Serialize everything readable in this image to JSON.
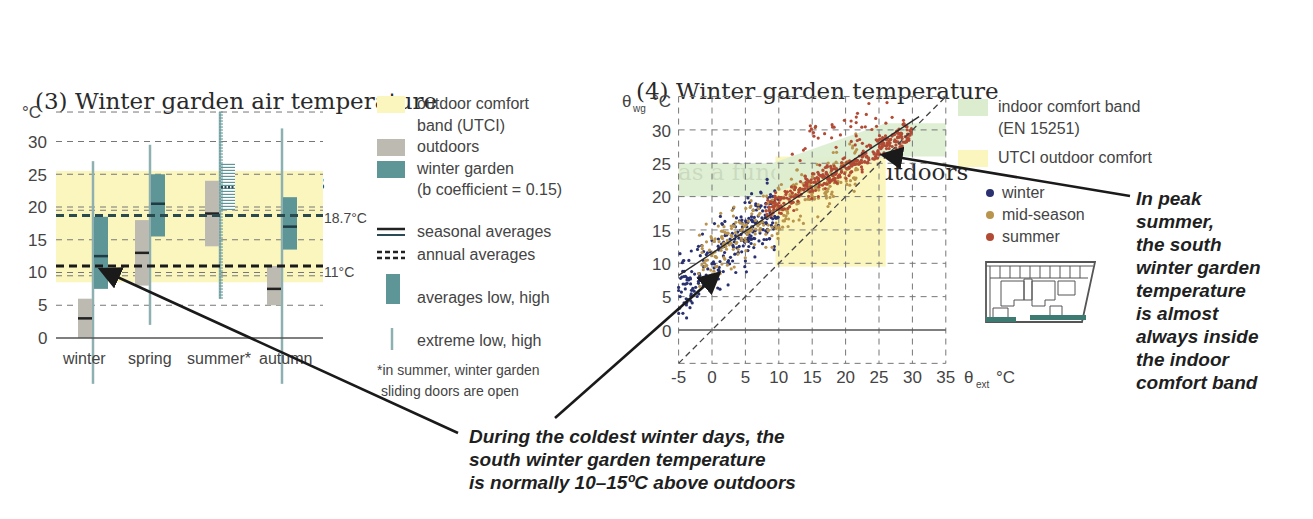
{
  "figure": {
    "chart3": {
      "title_line1": "(3) Winter garden air temperature",
      "title_line2": "compared to outdoors"
    },
    "chart4": {
      "title_line1": "(4) Winter garden temperature",
      "title_line2": "as a function of outdoors"
    },
    "callouts": {
      "winter": "During the coldest winter days, the\nsouth winter garden temperature\nis normally 10–15ºC above outdoors",
      "summer": "In peak\nsummer,\nthe south\nwinter garden\ntemperature\nis almost\nalways inside\nthe indoor\ncomfort band"
    }
  },
  "colors": {
    "utci_yellow": "#fbf6bd",
    "indoor_green": "#dcedcf",
    "outdoors_grey": "#bcbab1",
    "winter_garden_teal": "#5e9597",
    "extreme_line": "#8fb0b1",
    "winter_dot": "#2a3170",
    "midseason_dot": "#b9944c",
    "summer_dot": "#b24a34",
    "grid": "#777777",
    "arrow": "#1a1a1a"
  },
  "chart_data": [
    {
      "type": "box",
      "title": "(3) Winter garden air temperature compared to outdoors",
      "ylabel": "°C",
      "ylim": [
        0,
        35
      ],
      "yticks": [
        0,
        5,
        10,
        15,
        20,
        25,
        30
      ],
      "categories": [
        "winter",
        "spring",
        "summer*",
        "autumn"
      ],
      "outdoor_comfort_band_UTCI": [
        8.5,
        25.5
      ],
      "annual_averages": {
        "winter_garden": 18.7,
        "outdoors": 11,
        "labels": [
          "18.7°C",
          "11°C"
        ]
      },
      "series": [
        {
          "name": "outdoors",
          "extreme_low": [
            null,
            null,
            null,
            null
          ],
          "avg_low": [
            0,
            8,
            14,
            5
          ],
          "avg_high": [
            6,
            18,
            24,
            11
          ],
          "seasonal_average": [
            3,
            13,
            19,
            7.5
          ]
        },
        {
          "name": "winter garden (b coefficient = 0.15)",
          "extreme_low": [
            -7,
            2,
            6,
            -7
          ],
          "extreme_high": [
            27,
            29.5,
            34.5,
            32
          ],
          "avg_low": [
            7.5,
            15.5,
            19.5,
            13.5
          ],
          "avg_high": [
            18.5,
            25,
            26.5,
            21.5
          ],
          "seasonal_average": [
            12.5,
            20.5,
            23,
            17
          ]
        }
      ],
      "legend": [
        "outdoor comfort band (UTCI)",
        "outdoors",
        "winter garden (b coefficient = 0.15)",
        "seasonal averages",
        "annual averages",
        "averages low, high",
        "extreme low, high"
      ],
      "note": "*in summer, winter garden sliding doors are open"
    },
    {
      "type": "scatter",
      "title": "(4) Winter garden temperature as a function of outdoors",
      "xlabel": "θext °C",
      "ylabel": "θwg °C",
      "xlim": [
        -5,
        35
      ],
      "ylim": [
        -5,
        35
      ],
      "xticks": [
        -5,
        0,
        5,
        10,
        15,
        20,
        25,
        30,
        35
      ],
      "yticks": [
        0,
        5,
        10,
        15,
        20,
        25,
        30
      ],
      "grid": true,
      "indoor_comfort_band_EN15251": {
        "polygon": [
          [
            -5,
            20
          ],
          [
            8,
            20
          ],
          [
            8,
            25
          ],
          [
            10,
            25
          ],
          [
            26,
            28.5
          ],
          [
            35,
            29.5
          ],
          [
            35,
            25
          ],
          [
            26,
            25
          ],
          [
            26,
            25
          ],
          [
            10,
            20
          ]
        ],
        "description": "20–25°C for cold outdoor, rising to ~26–31°C at high outdoor"
      },
      "utci_outdoor_comfort": {
        "x": [
          9.5,
          26
        ],
        "y": [
          9.5,
          26
        ]
      },
      "identity_line": {
        "from": [
          -5,
          -5
        ],
        "to": [
          35,
          35
        ],
        "style": "dashed"
      },
      "regression_line": {
        "from": [
          -5,
          8.2
        ],
        "to": [
          31,
          32
        ],
        "style": "solid"
      },
      "series": [
        {
          "name": "winter",
          "color": "#2a3170",
          "x_range": [
            -5,
            10
          ],
          "y_range": [
            5,
            23
          ]
        },
        {
          "name": "mid-season",
          "color": "#b9944c",
          "x_range": [
            -2,
            22
          ],
          "y_range": [
            6,
            28
          ]
        },
        {
          "name": "summer",
          "color": "#b24a34",
          "x_range": [
            8,
            31
          ],
          "y_range": [
            16,
            32
          ]
        }
      ],
      "legend": [
        "indoor comfort band (EN 15251)",
        "UTCI outdoor comfort",
        "winter",
        "mid-season",
        "summer"
      ]
    }
  ],
  "legend3": {
    "utci": "outdoor comfort",
    "utci2": "band (UTCI)",
    "outdoors": "outdoors",
    "wg": "winter garden",
    "wg2": "(b coefficient = 0.15)",
    "seasonal": "seasonal averages",
    "annual": "annual averages",
    "avg": "averages low, high",
    "extreme": "extreme low, high",
    "note1": "*in summer, winter garden",
    "note2": "sliding doors are open",
    "annual_hi": "18.7°C",
    "annual_lo": "11°C"
  },
  "legend4": {
    "indoor": "indoor comfort band",
    "indoor2": "(EN 15251)",
    "utci": "UTCI outdoor comfort",
    "winter": "winter",
    "mid": "mid-season",
    "summer": "summer"
  },
  "axis3": {
    "unit": "°C",
    "yticks": [
      "0",
      "5",
      "10",
      "15",
      "20",
      "25",
      "30"
    ],
    "categories": [
      "winter",
      "spring",
      "summer*",
      "autumn"
    ]
  },
  "axis4": {
    "ylabel_theta": "θ",
    "ylabel_sub": "wg",
    "ylabel_unit": "°C",
    "xlabel_theta": "θ",
    "xlabel_sub": "ext",
    "xlabel_unit": "°C",
    "xticks": [
      "-5",
      "0",
      "5",
      "10",
      "15",
      "20",
      "25",
      "30",
      "35"
    ],
    "yticks": [
      "0",
      "5",
      "10",
      "15",
      "20",
      "25",
      "30"
    ]
  }
}
